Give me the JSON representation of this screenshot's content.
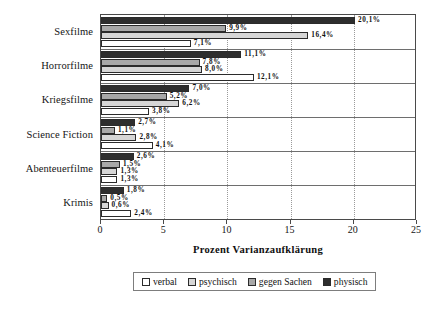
{
  "chart_data": {
    "type": "bar",
    "orientation": "horizontal",
    "title": "",
    "xlabel": "Prozent Varianzaufklärung",
    "ylabel": "",
    "xlim": [
      0,
      25
    ],
    "xticks": [
      "0",
      "5",
      "10",
      "15",
      "20",
      "25"
    ],
    "grid": "vertical-dotted",
    "legend_position": "bottom",
    "categories": [
      "Sexfilme",
      "Horrorfilme",
      "Kriegsfilme",
      "Science Fiction",
      "Abenteuerfilme",
      "Krimis"
    ],
    "series": [
      {
        "name": "physisch",
        "color": "#2e2e2e",
        "values": [
          20.1,
          11.1,
          7.0,
          2.7,
          2.6,
          1.8
        ],
        "labels": [
          "20,1%",
          "11,1%",
          "7,0%",
          "2,7%",
          "2,6%",
          "1,8%"
        ]
      },
      {
        "name": "gegen Sachen",
        "color": "#a8a8a8",
        "values": [
          9.9,
          7.8,
          5.2,
          1.1,
          1.5,
          0.5
        ],
        "labels": [
          "9,9%",
          "7,8%",
          "5,2%",
          "1,1%",
          "1,5%",
          "0,5%"
        ]
      },
      {
        "name": "psychisch",
        "color": "#d6d6d6",
        "values": [
          16.4,
          8.0,
          6.2,
          2.8,
          1.3,
          0.6
        ],
        "labels": [
          "16,4%",
          "8,0%",
          "6,2%",
          "2,8%",
          "1,3%",
          "0,6%"
        ]
      },
      {
        "name": "verbal",
        "color": "#ffffff",
        "values": [
          7.1,
          12.1,
          3.8,
          4.1,
          1.3,
          2.4
        ],
        "labels": [
          "7,1%",
          "12,1%",
          "3,8%",
          "4,1%",
          "1,3%",
          "2,4%"
        ]
      }
    ]
  },
  "legend": {
    "items": [
      {
        "label": "verbal",
        "swatch": "s-verbal"
      },
      {
        "label": "psychisch",
        "swatch": "s-psychisch"
      },
      {
        "label": "gegen Sachen",
        "swatch": "s-gegen"
      },
      {
        "label": "physisch",
        "swatch": "s-physisch"
      }
    ]
  }
}
